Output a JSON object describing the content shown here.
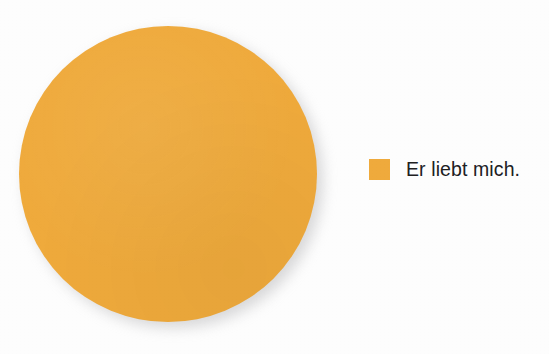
{
  "figure": {
    "background_color": "#fdfdfd",
    "accent_color": "#efaa3c",
    "text_color": "#20201f",
    "shadow_color": "#b9b9bb"
  },
  "legend": {
    "position": "right",
    "entries": [
      {
        "label": "Er liebt mich.",
        "color": "#efaa3c",
        "swatch_name": "legend-color-swatch"
      }
    ]
  },
  "chart_data": {
    "type": "pie",
    "title": "",
    "subtitle": "",
    "xlabel": "",
    "ylabel": "",
    "categories": [
      "Er liebt mich."
    ],
    "values": [
      100
    ],
    "value_unit": "percent",
    "colors": [
      "#efaa3c"
    ],
    "legend": [
      "Er liebt mich."
    ],
    "legend_position": "right",
    "grid": false,
    "labels_shown": false,
    "annotations": []
  }
}
